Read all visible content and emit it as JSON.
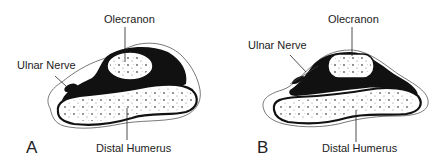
{
  "panels": [
    {
      "letter": "A",
      "labels": {
        "olecranon": "Olecranon",
        "ulnar_nerve": "Ulnar Nerve",
        "distal_humerus": "Distal Humerus"
      }
    },
    {
      "letter": "B",
      "labels": {
        "olecranon": "Olecranon",
        "ulnar_nerve": "Ulnar Nerve",
        "distal_humerus": "Distal Humerus"
      }
    }
  ],
  "colors": {
    "ink": "#1a1a1a",
    "background": "#ffffff"
  }
}
